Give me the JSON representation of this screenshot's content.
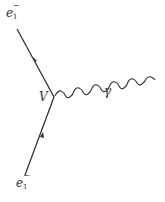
{
  "diagram": {
    "type": "feynman",
    "particles": {
      "incoming_top": {
        "symbol": "e",
        "subscript": "1",
        "superscript": "−"
      },
      "incoming_bottom": {
        "symbol": "e",
        "subscript": "1",
        "superscript": "−"
      },
      "photon": {
        "symbol": "γ"
      }
    },
    "vertex": {
      "label": "V"
    },
    "colors": {
      "line": "#333333",
      "label": "#333333"
    }
  }
}
